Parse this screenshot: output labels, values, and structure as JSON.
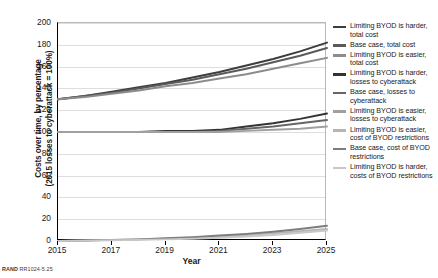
{
  "chart_data": {
    "type": "line",
    "title": "",
    "xlabel": "Year",
    "ylabel": "Costs over time, by percentage\n(2015 losses to cyberattack = 100%)",
    "x": [
      2015,
      2016,
      2017,
      2018,
      2019,
      2020,
      2021,
      2022,
      2023,
      2024,
      2025
    ],
    "xlim": [
      2015,
      2025
    ],
    "ylim": [
      0,
      200
    ],
    "yticks": [
      0,
      20,
      40,
      60,
      80,
      100,
      120,
      140,
      160,
      180,
      200
    ],
    "xticks": [
      2015,
      2017,
      2019,
      2021,
      2023,
      2025
    ],
    "grid": "horizontal",
    "legend_position": "right",
    "series": [
      {
        "name": "Limiting BYOD is harder, total cost",
        "color": "#3d3d3d",
        "width": 2.0,
        "values": [
          130,
          133,
          137,
          141,
          145,
          150,
          155,
          161,
          167,
          174,
          182
        ]
      },
      {
        "name": "Base case, total cost",
        "color": "#5a5a5a",
        "width": 2.0,
        "values": [
          130,
          133,
          136,
          140,
          144,
          148,
          153,
          158,
          164,
          170,
          177
        ]
      },
      {
        "name": "Limiting BYOD is easier, total cost",
        "color": "#8c8c8c",
        "width": 2.0,
        "values": [
          130,
          132,
          135,
          138,
          142,
          145,
          149,
          153,
          158,
          163,
          168
        ]
      },
      {
        "name": "Limiting BYOD is harder, losses to cyberattack",
        "color": "#333333",
        "width": 1.9,
        "values": [
          100,
          100,
          100,
          100,
          101,
          101,
          102,
          105,
          108,
          112,
          117
        ]
      },
      {
        "name": "Base case, losses to cyberattack",
        "color": "#666666",
        "width": 1.9,
        "values": [
          100,
          100,
          100,
          100,
          100,
          100,
          101,
          103,
          105,
          108,
          111
        ]
      },
      {
        "name": "Limiting BYOD is easier, losses to cyberattack",
        "color": "#a0a0a0",
        "width": 1.9,
        "values": [
          100,
          100,
          100,
          100,
          100,
          100,
          100,
          101,
          102,
          103,
          105
        ]
      },
      {
        "name": "Limiting BYOD is easier, cost of BYOD restrictions",
        "color": "#b5b5b5",
        "width": 1.9,
        "values": [
          0,
          0.5,
          1,
          1.5,
          2,
          3,
          4,
          5.5,
          7,
          9,
          11
        ]
      },
      {
        "name": "Base case, cost of BYOD restrictions",
        "color": "#7d7d7d",
        "width": 1.9,
        "values": [
          0,
          0.5,
          1,
          1.5,
          2.5,
          3.5,
          5,
          6.5,
          8.5,
          11,
          14
        ]
      },
      {
        "name": "Limiting BYOD is harder, costs of BYOD restrictions",
        "color": "#c8c8c8",
        "width": 1.9,
        "values": [
          0,
          0.3,
          0.7,
          1,
          1.5,
          2,
          3,
          4,
          5.5,
          7.5,
          9.5
        ]
      }
    ]
  },
  "legend": {
    "items": [
      {
        "label": "Limiting BYOD is harder, total cost",
        "color": "#3d3d3d"
      },
      {
        "label": "Base case, total cost",
        "color": "#5a5a5a"
      },
      {
        "label": "Limiting BYOD is easier, total cost",
        "color": "#8c8c8c"
      },
      {
        "label": "Limiting BYOD is harder, losses to cyberattack",
        "color": "#333333"
      },
      {
        "label": "Base case, losses to cyberattack",
        "color": "#666666"
      },
      {
        "label": "Limiting BYOD is easier, losses to cyberattack",
        "color": "#a0a0a0"
      },
      {
        "label": "Limiting BYOD is easier, cost of BYOD restrictions",
        "color": "#b5b5b5"
      },
      {
        "label": "Base case, cost of BYOD restrictions",
        "color": "#7d7d7d"
      },
      {
        "label": "Limiting BYOD is harder, costs of BYOD restrictions",
        "color": "#c8c8c8"
      }
    ]
  },
  "footer": {
    "brand": "RAND",
    "figure_id": "RR1024-5.25"
  }
}
